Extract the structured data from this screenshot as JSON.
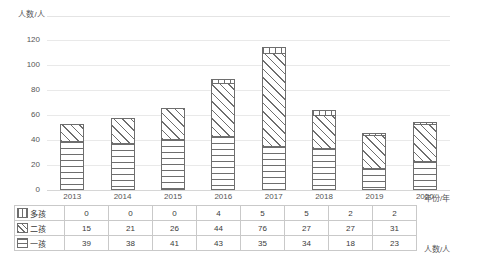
{
  "chart_data": {
    "type": "bar",
    "stacked": true,
    "title": "",
    "xlabel": "年份/年",
    "ylabel": "人数/人",
    "top_axis_title": "人数/人",
    "side_table_label": "人数/人",
    "categories": [
      "2013",
      "2014",
      "2015",
      "2016",
      "2017",
      "2018",
      "2019",
      "2020"
    ],
    "series": [
      {
        "name": "多孩",
        "pattern": "vertical-lines",
        "values": [
          0,
          0,
          0,
          4,
          5,
          5,
          2,
          2
        ]
      },
      {
        "name": "二孩",
        "pattern": "diagonal-hatch",
        "values": [
          15,
          21,
          26,
          44,
          76,
          27,
          27,
          31
        ]
      },
      {
        "name": "一孩",
        "pattern": "horizontal-lines",
        "values": [
          39,
          38,
          41,
          43,
          35,
          34,
          18,
          23
        ]
      }
    ],
    "stack_order_bottom_to_top": [
      "一孩",
      "二孩",
      "多孩"
    ],
    "totals": [
      54,
      59,
      67,
      91,
      116,
      66,
      47,
      56
    ],
    "ylim": [
      0,
      130
    ],
    "yticks": [
      0,
      20,
      40,
      60,
      80,
      100,
      120
    ],
    "grid": true,
    "legend": "row-headers-in-table"
  },
  "table": {
    "rows": [
      {
        "label": "多孩",
        "swatch": "many",
        "values": [
          "0",
          "0",
          "0",
          "4",
          "5",
          "5",
          "2",
          "2"
        ]
      },
      {
        "label": "二孩",
        "swatch": "two",
        "values": [
          "15",
          "21",
          "26",
          "44",
          "76",
          "27",
          "27",
          "31"
        ]
      },
      {
        "label": "一孩",
        "swatch": "one",
        "values": [
          "39",
          "38",
          "41",
          "43",
          "35",
          "34",
          "18",
          "23"
        ]
      }
    ]
  },
  "labels": {
    "year_axis": "年份/年",
    "count_axis": "人数/人"
  }
}
